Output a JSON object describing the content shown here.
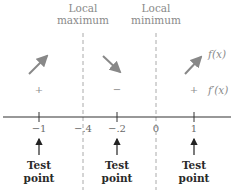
{
  "headers": {
    "local_max": {
      "line1": "Local",
      "line2": "maximum"
    },
    "local_min": {
      "line1": "Local",
      "line2": "minimum"
    }
  },
  "function_labels": {
    "f": "f(x)",
    "f_prime": "f′(x)"
  },
  "signs": [
    "+",
    "−",
    "+"
  ],
  "tick_labels": [
    "−1",
    "−.4",
    "−.2",
    "0",
    "1"
  ],
  "test_points": [
    {
      "line1": "Test",
      "line2": "point"
    },
    {
      "line1": "Test",
      "line2": "point"
    },
    {
      "line1": "Test",
      "line2": "point"
    }
  ],
  "colors": {
    "axis": "#333333",
    "dashed": "#aaaaaa",
    "arrow_gray": "#888888",
    "test_arrow": "#222222"
  }
}
